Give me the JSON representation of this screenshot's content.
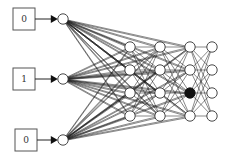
{
  "diagram": {
    "type": "neural-network",
    "inputs": [
      {
        "label": "0"
      },
      {
        "label": "1"
      },
      {
        "label": "0"
      }
    ],
    "layers": [
      {
        "name": "input",
        "size": 3,
        "active": []
      },
      {
        "name": "hidden-1",
        "size": 4,
        "active": []
      },
      {
        "name": "hidden-2",
        "size": 4,
        "active": []
      },
      {
        "name": "hidden-3",
        "size": 4,
        "active": [
          2
        ]
      },
      {
        "name": "output",
        "size": 4,
        "active": []
      }
    ],
    "skip_connections_from_input_to": [
      "hidden-1",
      "hidden-2",
      "hidden-3"
    ],
    "colors": {
      "edge": "#1a1a1a",
      "node_fill": "#ffffff",
      "active_fill": "#111111"
    }
  }
}
